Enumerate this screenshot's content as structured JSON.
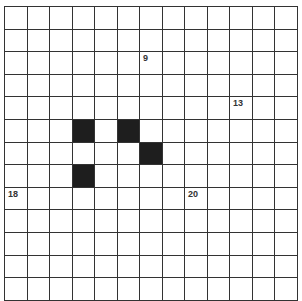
{
  "puzzle": {
    "type": "crossword-grid",
    "cols": 13,
    "rows": 13,
    "colors": {
      "line": "#333333",
      "black": "#1e1e1e",
      "white": "#ffffff"
    },
    "black_cells": [
      {
        "row": 5,
        "col": 3
      },
      {
        "row": 5,
        "col": 5
      },
      {
        "row": 6,
        "col": 6
      },
      {
        "row": 7,
        "col": 3
      }
    ],
    "numbers": [
      {
        "row": 2,
        "col": 6,
        "label": "9"
      },
      {
        "row": 4,
        "col": 10,
        "label": "13"
      },
      {
        "row": 8,
        "col": 0,
        "label": "18"
      },
      {
        "row": 8,
        "col": 8,
        "label": "20"
      }
    ]
  }
}
